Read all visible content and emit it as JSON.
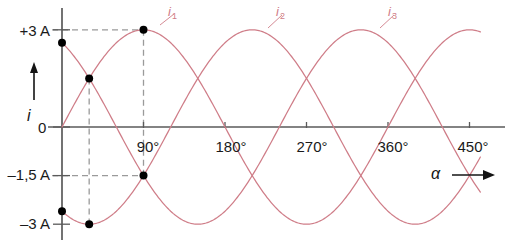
{
  "chart_data": {
    "type": "line",
    "title": "",
    "subtitle": "",
    "xlabel": "α",
    "ylabel": "i",
    "xlim": [
      -20,
      470
    ],
    "ylim": [
      -3.4,
      3.3
    ],
    "xunit": "degrees",
    "yunit": "A",
    "grid": false,
    "legend": "inline-curve-labels",
    "x_ticks": [
      {
        "value": 90,
        "label": "90°"
      },
      {
        "value": 180,
        "label": "180°"
      },
      {
        "value": 270,
        "label": "270°"
      },
      {
        "value": 360,
        "label": "360°"
      },
      {
        "value": 450,
        "label": "450°"
      }
    ],
    "y_ticks": [
      {
        "value": 3,
        "label": "+3 A"
      },
      {
        "value": 0,
        "label": "0"
      },
      {
        "value": -1.5,
        "label": "–1,5 A"
      },
      {
        "value": -3,
        "label": "–3 A"
      }
    ],
    "amplitude": 3,
    "series": [
      {
        "name": "i₁",
        "label": "i",
        "sub": "1",
        "phase_deg": 0,
        "color": "#cf7d88",
        "label_x": 180,
        "label_y": 3.35,
        "values_at_deg": {
          "0": 0,
          "90": 3,
          "180": 0,
          "270": -3,
          "360": 0,
          "450": 3
        }
      },
      {
        "name": "i₂",
        "label": "i",
        "sub": "2",
        "phase_deg": -120,
        "color": "#cf7d88",
        "label_x": 300,
        "label_y": 3.35,
        "values_at_deg": {
          "0": -2.6,
          "90": -1.5,
          "120": 0,
          "210": 3,
          "300": 0,
          "390": -3
        }
      },
      {
        "name": "i₃",
        "label": "i",
        "sub": "3",
        "phase_deg": 120,
        "color": "#cf7d88",
        "label_x": 423,
        "label_y": 3.35,
        "values_at_deg": {
          "0": 2.6,
          "60": 0,
          "90": -1.5,
          "150": -3,
          "240": 0,
          "330": 3
        }
      }
    ],
    "markers": [
      {
        "x": 0,
        "y": 2.6,
        "note": "i3 at alpha=0"
      },
      {
        "x": 0,
        "y": -2.6,
        "note": "i2 at alpha=0"
      },
      {
        "x": 30,
        "y": 1.5,
        "note": "i1 and i3 crossing"
      },
      {
        "x": 30,
        "y": -3,
        "note": "i2 minimum"
      },
      {
        "x": 90,
        "y": 3,
        "note": "i1 maximum"
      },
      {
        "x": 90,
        "y": -1.5,
        "note": "i2 and i3 crossing"
      }
    ],
    "guides": [
      {
        "type": "h",
        "y": 3,
        "x_from": 0,
        "x_to": 90
      },
      {
        "type": "h",
        "y": -1.5,
        "x_from": 0,
        "x_to": 90
      },
      {
        "type": "v",
        "x": 30,
        "y_from": 1.5,
        "y_to": -3
      },
      {
        "type": "v",
        "x": 90,
        "y_from": 3,
        "y_to": -1.5
      }
    ],
    "colors": {
      "curve": "#cf7d88",
      "axis": "#5a5a5a",
      "guide": "#9a9a9a",
      "marker": "#000000",
      "text": "#1a1a1a",
      "series_label": "#cf7d88",
      "background": "#ffffff"
    }
  }
}
